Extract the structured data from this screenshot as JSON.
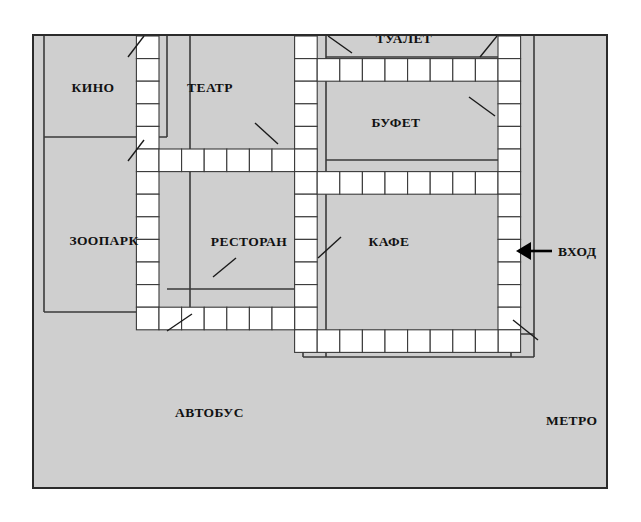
{
  "page": {
    "background_color": "#ffffff"
  },
  "map": {
    "frame": {
      "background_color": "#cfcfcf",
      "border_color": "#2b2b2b"
    },
    "corridor_cell_color": "#ffffff",
    "wall_color": "#3a3a3a",
    "rooms": [
      {
        "id": "kino",
        "label": "КИНО",
        "cx": 93,
        "cy": 172
      },
      {
        "id": "teatr",
        "label": "ТЕАТР",
        "cx": 210,
        "cy": 172
      },
      {
        "id": "tualet",
        "label": "ТУАЛЕТ",
        "cx": 404,
        "cy": 123
      },
      {
        "id": "bufet",
        "label": "БУФЕТ",
        "cx": 396,
        "cy": 207
      },
      {
        "id": "zoopark",
        "label": "ЗООПАРК",
        "cx": 104,
        "cy": 325
      },
      {
        "id": "restoran",
        "label": "РЕСТОРАН",
        "cx": 249,
        "cy": 326
      },
      {
        "id": "kafe",
        "label": "КАФЕ",
        "cx": 389,
        "cy": 326
      }
    ],
    "external_labels": [
      {
        "id": "vhod",
        "label": "ВХОД",
        "x": 558,
        "y": 256,
        "anchor": "start"
      },
      {
        "id": "metro",
        "label": "МЕТРО",
        "x": 546,
        "y": 425,
        "anchor": "start"
      },
      {
        "id": "avtobus",
        "label": "АВТОБУС",
        "x": 175,
        "y": 417,
        "anchor": "start"
      }
    ],
    "entrance_arrow": {
      "name": "vhod-arrow",
      "direction": "left",
      "tip_x": 516,
      "tail_x": 552,
      "y": 251,
      "color": "#000000"
    },
    "leader_lines": [
      {
        "id": "kino-leader",
        "x1": 128,
        "y1": 137,
        "x2": 144,
        "y2": 116
      },
      {
        "id": "zoopark-leader",
        "x1": 128,
        "y1": 241,
        "x2": 144,
        "y2": 220
      },
      {
        "id": "teatr-leader",
        "x1": 255,
        "y1": 203,
        "x2": 278,
        "y2": 224
      },
      {
        "id": "tualet-leader-l",
        "x1": 328,
        "y1": 116,
        "x2": 352,
        "y2": 133
      },
      {
        "id": "tualet-leader-r",
        "x1": 480,
        "y1": 137,
        "x2": 497,
        "y2": 116
      },
      {
        "id": "bufet-leader",
        "x1": 469,
        "y1": 177,
        "x2": 495,
        "y2": 196
      },
      {
        "id": "restoran-leader",
        "x1": 213,
        "y1": 357,
        "x2": 236,
        "y2": 338
      },
      {
        "id": "kafe-leader",
        "x1": 318,
        "y1": 338,
        "x2": 341,
        "y2": 317
      },
      {
        "id": "avtobus-leader",
        "x1": 167,
        "y1": 411,
        "x2": 192,
        "y2": 394
      },
      {
        "id": "metro-leader",
        "x1": 538,
        "y1": 420,
        "x2": 513,
        "y2": 400
      }
    ]
  },
  "grid": {
    "origin_x": 44,
    "origin_y": 114,
    "cell_w": 22.6,
    "cell_h": 22.6,
    "cols": 21,
    "rows": 14,
    "corridor_cells": [
      [
        4,
        0
      ],
      [
        4,
        1
      ],
      [
        4,
        2
      ],
      [
        4,
        3
      ],
      [
        4,
        4
      ],
      [
        4,
        5
      ],
      [
        4,
        6
      ],
      [
        4,
        7
      ],
      [
        4,
        8
      ],
      [
        4,
        9
      ],
      [
        4,
        10
      ],
      [
        4,
        11
      ],
      [
        4,
        12
      ],
      [
        5,
        5
      ],
      [
        6,
        5
      ],
      [
        7,
        5
      ],
      [
        8,
        5
      ],
      [
        9,
        5
      ],
      [
        10,
        5
      ],
      [
        11,
        5
      ],
      [
        11,
        0
      ],
      [
        11,
        1
      ],
      [
        11,
        2
      ],
      [
        11,
        3
      ],
      [
        11,
        4
      ],
      [
        11,
        5
      ],
      [
        11,
        6
      ],
      [
        11,
        7
      ],
      [
        11,
        8
      ],
      [
        11,
        9
      ],
      [
        11,
        10
      ],
      [
        11,
        11
      ],
      [
        11,
        12
      ],
      [
        11,
        13
      ],
      [
        12,
        1
      ],
      [
        13,
        1
      ],
      [
        14,
        1
      ],
      [
        15,
        1
      ],
      [
        16,
        1
      ],
      [
        17,
        1
      ],
      [
        18,
        1
      ],
      [
        19,
        1
      ],
      [
        12,
        6
      ],
      [
        13,
        6
      ],
      [
        14,
        6
      ],
      [
        15,
        6
      ],
      [
        16,
        6
      ],
      [
        17,
        6
      ],
      [
        18,
        6
      ],
      [
        19,
        6
      ],
      [
        20,
        0
      ],
      [
        20,
        1
      ],
      [
        20,
        2
      ],
      [
        20,
        3
      ],
      [
        20,
        4
      ],
      [
        20,
        5
      ],
      [
        20,
        6
      ],
      [
        20,
        7
      ],
      [
        20,
        8
      ],
      [
        20,
        9
      ],
      [
        20,
        10
      ],
      [
        20,
        11
      ],
      [
        20,
        12
      ],
      [
        20,
        13
      ],
      [
        12,
        13
      ],
      [
        13,
        13
      ],
      [
        14,
        13
      ],
      [
        15,
        13
      ],
      [
        16,
        13
      ],
      [
        17,
        13
      ],
      [
        18,
        13
      ],
      [
        19,
        13
      ],
      [
        5,
        12
      ],
      [
        6,
        12
      ],
      [
        7,
        12
      ],
      [
        8,
        12
      ],
      [
        9,
        12
      ],
      [
        10,
        12
      ]
    ]
  }
}
